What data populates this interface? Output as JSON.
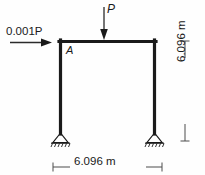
{
  "diagram": {
    "type": "structural-portal-frame",
    "loads": {
      "vertical": {
        "label": "P",
        "direction": "down",
        "position": "midspan-of-beam"
      },
      "lateral": {
        "label": "0.001P",
        "direction": "right",
        "position": "joint-A-top-left"
      }
    },
    "joints": {
      "a": "A"
    },
    "dimensions": {
      "span": "6.096 m",
      "height": "6.096 m"
    },
    "supports": {
      "left": "pinned",
      "right": "pinned",
      "count": 2
    },
    "colors": {
      "member": "#1a1a1a",
      "dimension": "#4d4d4d",
      "background": "#fefefe"
    }
  }
}
